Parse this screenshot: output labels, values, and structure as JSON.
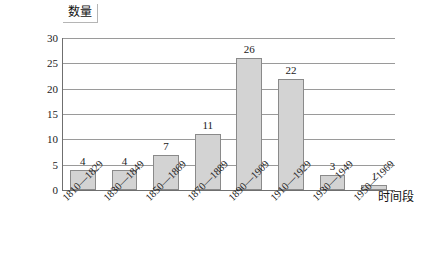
{
  "chart_data": {
    "type": "bar",
    "title": "",
    "xlabel": "时间段",
    "ylabel": "数量",
    "categories": [
      "1810—1829",
      "1830—1849",
      "1850—1869",
      "1870—1889",
      "1890—1909",
      "1910—1929",
      "1930—1949",
      "1950—1969"
    ],
    "values": [
      4,
      4,
      7,
      11,
      26,
      22,
      3,
      1
    ],
    "ylim": [
      0,
      30
    ],
    "ytick_values": [
      0,
      5,
      10,
      15,
      20,
      25,
      30
    ],
    "ytick_labels": [
      "0",
      "5",
      "10",
      "15",
      "20",
      "25",
      "30"
    ],
    "grid": true,
    "grid_axis": "y",
    "legend": false,
    "legend_position": "none",
    "bar_labels": [
      "4",
      "4",
      "7",
      "11",
      "26",
      "22",
      "3",
      "1"
    ],
    "bar_color": "#d3d3d3",
    "bar_border_color": "#8a8a8a",
    "gridline_color": "#9a9a9a",
    "axis_color": "#6f6f6f",
    "background_color": "#ffffff",
    "xtick_rotation": -45
  }
}
